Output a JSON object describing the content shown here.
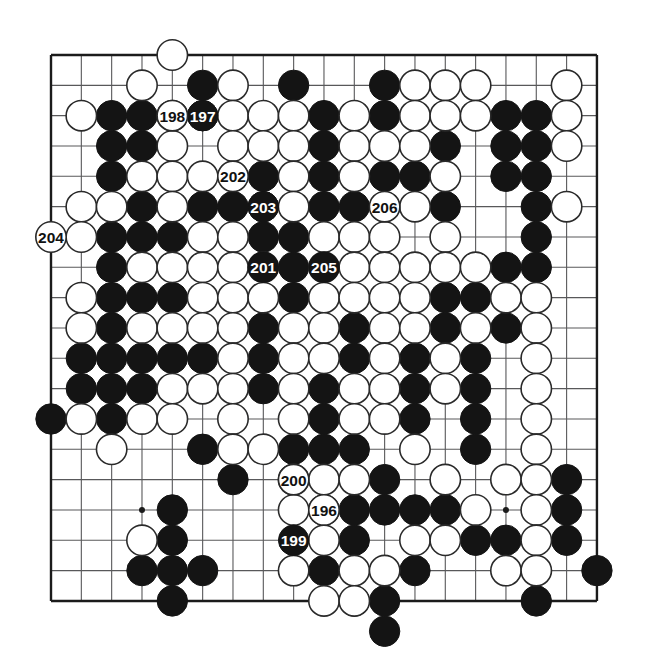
{
  "diagram": {
    "type": "go-board-game-record",
    "board_size": 19,
    "move_range": "196-206",
    "colors": {
      "background": "#ffffff",
      "grid": "#58585a",
      "border": "#1b1b1b",
      "black_stone": "#141414",
      "white_stone": "#ffffff",
      "white_stone_outline": "#2a2a2a",
      "label_on_black": "#ffffff",
      "label_on_white": "#111111"
    },
    "geometry": {
      "origin_x": 51,
      "origin_y": 55,
      "spacing": 30.33,
      "stone_radius": 15.2,
      "hoshi_radius": 3
    },
    "hoshi_points": [
      [
        3,
        3
      ],
      [
        9,
        3
      ],
      [
        15,
        3
      ],
      [
        3,
        9
      ],
      [
        9,
        9
      ],
      [
        15,
        9
      ],
      [
        3,
        15
      ],
      [
        9,
        15
      ],
      [
        15,
        15
      ]
    ],
    "black_stones": [
      [
        5,
        1
      ],
      [
        8,
        1
      ],
      [
        11,
        1
      ],
      [
        2,
        2
      ],
      [
        3,
        2
      ],
      [
        5,
        2
      ],
      [
        9,
        2
      ],
      [
        11,
        2
      ],
      [
        15,
        2
      ],
      [
        16,
        2
      ],
      [
        2,
        3
      ],
      [
        3,
        3
      ],
      [
        9,
        3
      ],
      [
        13,
        3
      ],
      [
        15,
        3
      ],
      [
        16,
        3
      ],
      [
        2,
        4
      ],
      [
        6,
        4
      ],
      [
        7,
        4
      ],
      [
        9,
        4
      ],
      [
        11,
        4
      ],
      [
        12,
        4
      ],
      [
        15,
        4
      ],
      [
        16,
        4
      ],
      [
        3,
        5
      ],
      [
        5,
        5
      ],
      [
        6,
        5
      ],
      [
        7,
        5
      ],
      [
        9,
        5
      ],
      [
        10,
        5
      ],
      [
        11,
        5
      ],
      [
        13,
        5
      ],
      [
        16,
        5
      ],
      [
        2,
        6
      ],
      [
        3,
        6
      ],
      [
        4,
        6
      ],
      [
        7,
        6
      ],
      [
        8,
        6
      ],
      [
        16,
        6
      ],
      [
        2,
        7
      ],
      [
        8,
        7
      ],
      [
        15,
        7
      ],
      [
        16,
        7
      ],
      [
        2,
        8
      ],
      [
        3,
        8
      ],
      [
        4,
        8
      ],
      [
        8,
        8
      ],
      [
        13,
        8
      ],
      [
        14,
        8
      ],
      [
        2,
        9
      ],
      [
        7,
        9
      ],
      [
        10,
        9
      ],
      [
        13,
        9
      ],
      [
        15,
        9
      ],
      [
        1,
        10
      ],
      [
        2,
        10
      ],
      [
        3,
        10
      ],
      [
        4,
        10
      ],
      [
        5,
        10
      ],
      [
        7,
        10
      ],
      [
        10,
        10
      ],
      [
        12,
        10
      ],
      [
        14,
        10
      ],
      [
        1,
        11
      ],
      [
        2,
        11
      ],
      [
        3,
        11
      ],
      [
        7,
        11
      ],
      [
        9,
        11
      ],
      [
        12,
        11
      ],
      [
        14,
        11
      ],
      [
        0,
        12
      ],
      [
        2,
        12
      ],
      [
        9,
        12
      ],
      [
        12,
        12
      ],
      [
        14,
        12
      ],
      [
        5,
        13
      ],
      [
        8,
        13
      ],
      [
        9,
        13
      ],
      [
        10,
        13
      ],
      [
        14,
        13
      ],
      [
        6,
        14
      ],
      [
        11,
        14
      ],
      [
        17,
        14
      ],
      [
        4,
        15
      ],
      [
        10,
        15
      ],
      [
        11,
        15
      ],
      [
        12,
        15
      ],
      [
        13,
        15
      ],
      [
        17,
        15
      ],
      [
        4,
        16
      ],
      [
        10,
        16
      ],
      [
        14,
        16
      ],
      [
        15,
        16
      ],
      [
        17,
        16
      ],
      [
        3,
        17
      ],
      [
        4,
        17
      ],
      [
        5,
        17
      ],
      [
        9,
        17
      ],
      [
        12,
        17
      ],
      [
        4,
        18
      ],
      [
        10,
        18
      ],
      [
        11,
        18
      ],
      [
        16,
        18
      ],
      [
        18,
        17
      ],
      [
        11,
        19
      ]
    ],
    "white_stones": [
      [
        4,
        0
      ],
      [
        3,
        1
      ],
      [
        6,
        1
      ],
      [
        12,
        1
      ],
      [
        13,
        1
      ],
      [
        14,
        1
      ],
      [
        17,
        1
      ],
      [
        1,
        2
      ],
      [
        4,
        2
      ],
      [
        6,
        2
      ],
      [
        7,
        2
      ],
      [
        8,
        2
      ],
      [
        10,
        2
      ],
      [
        12,
        2
      ],
      [
        13,
        2
      ],
      [
        14,
        2
      ],
      [
        17,
        2
      ],
      [
        4,
        3
      ],
      [
        6,
        3
      ],
      [
        7,
        3
      ],
      [
        8,
        3
      ],
      [
        10,
        3
      ],
      [
        11,
        3
      ],
      [
        12,
        3
      ],
      [
        17,
        3
      ],
      [
        3,
        4
      ],
      [
        4,
        4
      ],
      [
        5,
        4
      ],
      [
        8,
        4
      ],
      [
        10,
        4
      ],
      [
        13,
        4
      ],
      [
        1,
        5
      ],
      [
        2,
        5
      ],
      [
        4,
        5
      ],
      [
        8,
        5
      ],
      [
        12,
        5
      ],
      [
        17,
        5
      ],
      [
        1,
        6
      ],
      [
        5,
        6
      ],
      [
        6,
        6
      ],
      [
        9,
        6
      ],
      [
        10,
        6
      ],
      [
        11,
        6
      ],
      [
        13,
        6
      ],
      [
        3,
        7
      ],
      [
        4,
        7
      ],
      [
        5,
        7
      ],
      [
        6,
        7
      ],
      [
        7,
        7
      ],
      [
        9,
        7
      ],
      [
        10,
        7
      ],
      [
        11,
        7
      ],
      [
        12,
        7
      ],
      [
        13,
        7
      ],
      [
        14,
        7
      ],
      [
        1,
        8
      ],
      [
        5,
        8
      ],
      [
        6,
        8
      ],
      [
        7,
        8
      ],
      [
        9,
        8
      ],
      [
        10,
        8
      ],
      [
        11,
        8
      ],
      [
        12,
        8
      ],
      [
        15,
        8
      ],
      [
        16,
        8
      ],
      [
        1,
        9
      ],
      [
        3,
        9
      ],
      [
        4,
        9
      ],
      [
        5,
        9
      ],
      [
        6,
        9
      ],
      [
        8,
        9
      ],
      [
        9,
        9
      ],
      [
        11,
        9
      ],
      [
        12,
        9
      ],
      [
        14,
        9
      ],
      [
        16,
        9
      ],
      [
        6,
        10
      ],
      [
        8,
        10
      ],
      [
        9,
        10
      ],
      [
        11,
        10
      ],
      [
        13,
        10
      ],
      [
        16,
        10
      ],
      [
        4,
        11
      ],
      [
        5,
        11
      ],
      [
        6,
        11
      ],
      [
        8,
        11
      ],
      [
        10,
        11
      ],
      [
        11,
        11
      ],
      [
        13,
        11
      ],
      [
        16,
        11
      ],
      [
        1,
        12
      ],
      [
        3,
        12
      ],
      [
        4,
        12
      ],
      [
        6,
        12
      ],
      [
        8,
        12
      ],
      [
        10,
        12
      ],
      [
        11,
        12
      ],
      [
        16,
        12
      ],
      [
        2,
        13
      ],
      [
        6,
        13
      ],
      [
        7,
        13
      ],
      [
        12,
        13
      ],
      [
        16,
        13
      ],
      [
        8,
        14
      ],
      [
        9,
        14
      ],
      [
        10,
        14
      ],
      [
        13,
        14
      ],
      [
        15,
        14
      ],
      [
        16,
        14
      ],
      [
        8,
        15
      ],
      [
        9,
        15
      ],
      [
        14,
        15
      ],
      [
        16,
        15
      ],
      [
        3,
        16
      ],
      [
        9,
        16
      ],
      [
        12,
        16
      ],
      [
        13,
        16
      ],
      [
        16,
        16
      ],
      [
        8,
        17
      ],
      [
        10,
        17
      ],
      [
        11,
        17
      ],
      [
        15,
        17
      ],
      [
        16,
        17
      ],
      [
        9,
        18
      ],
      [
        10,
        18
      ]
    ],
    "numbered_moves": [
      {
        "number": "196",
        "color": "white",
        "col": 9,
        "row": 15
      },
      {
        "number": "197",
        "color": "black",
        "col": 5,
        "row": 2
      },
      {
        "number": "198",
        "color": "white",
        "col": 4,
        "row": 2
      },
      {
        "number": "199",
        "color": "black",
        "col": 8,
        "row": 16
      },
      {
        "number": "200",
        "color": "white",
        "col": 8,
        "row": 14
      },
      {
        "number": "201",
        "color": "black",
        "col": 7,
        "row": 7
      },
      {
        "number": "202",
        "color": "white",
        "col": 6,
        "row": 4
      },
      {
        "number": "203",
        "color": "black",
        "col": 7,
        "row": 5
      },
      {
        "number": "204",
        "color": "white",
        "col": 0,
        "row": 6
      },
      {
        "number": "205",
        "color": "black",
        "col": 9,
        "row": 7
      },
      {
        "number": "206",
        "color": "white",
        "col": 11,
        "row": 5
      }
    ]
  }
}
